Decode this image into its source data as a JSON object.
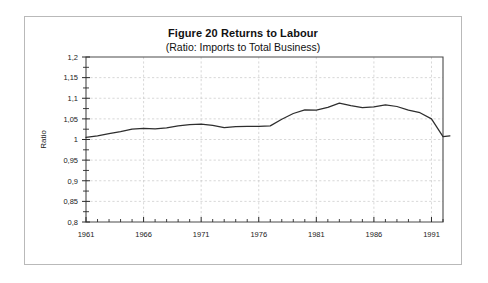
{
  "figure": {
    "title": "Figure 20  Returns to Labour",
    "subtitle": "(Ratio: Imports to Total Business)"
  },
  "chart_data": {
    "type": "line",
    "title": "Figure 20  Returns to Labour",
    "subtitle": "(Ratio: Imports to Total Business)",
    "xlabel": "",
    "ylabel": "Ratio",
    "xlim": [
      1961,
      1992
    ],
    "ylim": [
      0.8,
      1.2
    ],
    "grid": true,
    "legend": "none",
    "ytick_labels": [
      "1,2",
      "1,15",
      "1,1",
      "1,05",
      "1",
      "0,95",
      "0,9",
      "0,85",
      "0,8"
    ],
    "ytick_values": [
      1.2,
      1.15,
      1.1,
      1.05,
      1.0,
      0.95,
      0.9,
      0.85,
      0.8
    ],
    "ytick_step": 0.05,
    "xtick_labels": [
      "1961",
      "1966",
      "1971",
      "1976",
      "1981",
      "1986",
      "1991"
    ],
    "xtick_values": [
      1961,
      1966,
      1971,
      1976,
      1981,
      1986,
      1991
    ],
    "xtick_minor_step": 1,
    "line_color": "#2e2e2e",
    "x": [
      1961,
      1962,
      1963,
      1964,
      1965,
      1966,
      1967,
      1968,
      1969,
      1970,
      1971,
      1972,
      1973,
      1974,
      1975,
      1976,
      1977,
      1978,
      1979,
      1980,
      1981,
      1982,
      1983,
      1984,
      1985,
      1986,
      1987,
      1988,
      1989,
      1990,
      1991,
      1992
    ],
    "values": [
      1.005,
      1.009,
      1.014,
      1.019,
      1.025,
      1.027,
      1.026,
      1.028,
      1.033,
      1.036,
      1.037,
      1.034,
      1.029,
      1.031,
      1.032,
      1.032,
      1.033,
      1.049,
      1.063,
      1.072,
      1.071,
      1.078,
      1.088,
      1.082,
      1.077,
      1.079,
      1.084,
      1.08,
      1.071,
      1.065,
      1.05,
      1.007
    ],
    "series": [
      {
        "name": "Ratio: Imports to Total Business",
        "values": [
          1.005,
          1.009,
          1.014,
          1.019,
          1.025,
          1.027,
          1.026,
          1.028,
          1.033,
          1.036,
          1.037,
          1.034,
          1.029,
          1.031,
          1.032,
          1.032,
          1.033,
          1.049,
          1.063,
          1.072,
          1.071,
          1.078,
          1.088,
          1.082,
          1.077,
          1.079,
          1.084,
          1.08,
          1.071,
          1.065,
          1.05,
          1.007
        ]
      }
    ],
    "tail_x": [
      1992,
      1992.6
    ],
    "tail_values": [
      1.007,
      1.009
    ]
  }
}
